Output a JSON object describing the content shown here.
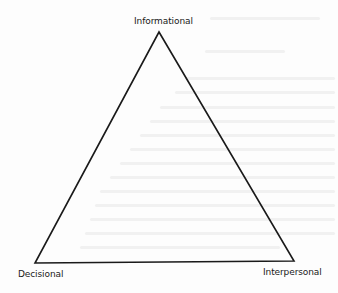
{
  "diagram": {
    "type": "triangle",
    "vertices": [
      {
        "id": "top",
        "label": "Informational"
      },
      {
        "id": "bottom-left",
        "label": "Decisional"
      },
      {
        "id": "bottom-right",
        "label": "Interpersonal"
      }
    ],
    "stroke_color": "#1a1a1a",
    "background_color": "#fdfdfd"
  }
}
